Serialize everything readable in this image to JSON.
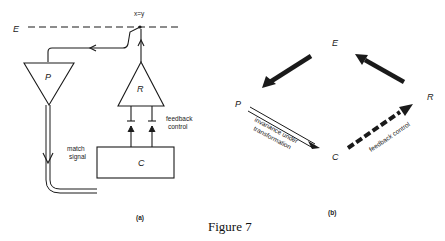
{
  "figure": {
    "caption": "Figure 7",
    "panel_a": {
      "label": "(a)",
      "node_E": "E",
      "node_P": "P",
      "node_R": "R",
      "node_C": "C",
      "equation": "x=y",
      "match_signal_line1": "match",
      "match_signal_line2": "signal",
      "feedback_line1": "feedback",
      "feedback_line2": "control"
    },
    "panel_b": {
      "label": "(b)",
      "node_E": "E",
      "node_P": "P",
      "node_R": "R",
      "node_C": "C",
      "invariance_line1": "invariance under",
      "invariance_line2": "transformation",
      "feedback": "feedback control"
    },
    "colors": {
      "ink": "#1a1a1a",
      "background": "#ffffff"
    }
  }
}
